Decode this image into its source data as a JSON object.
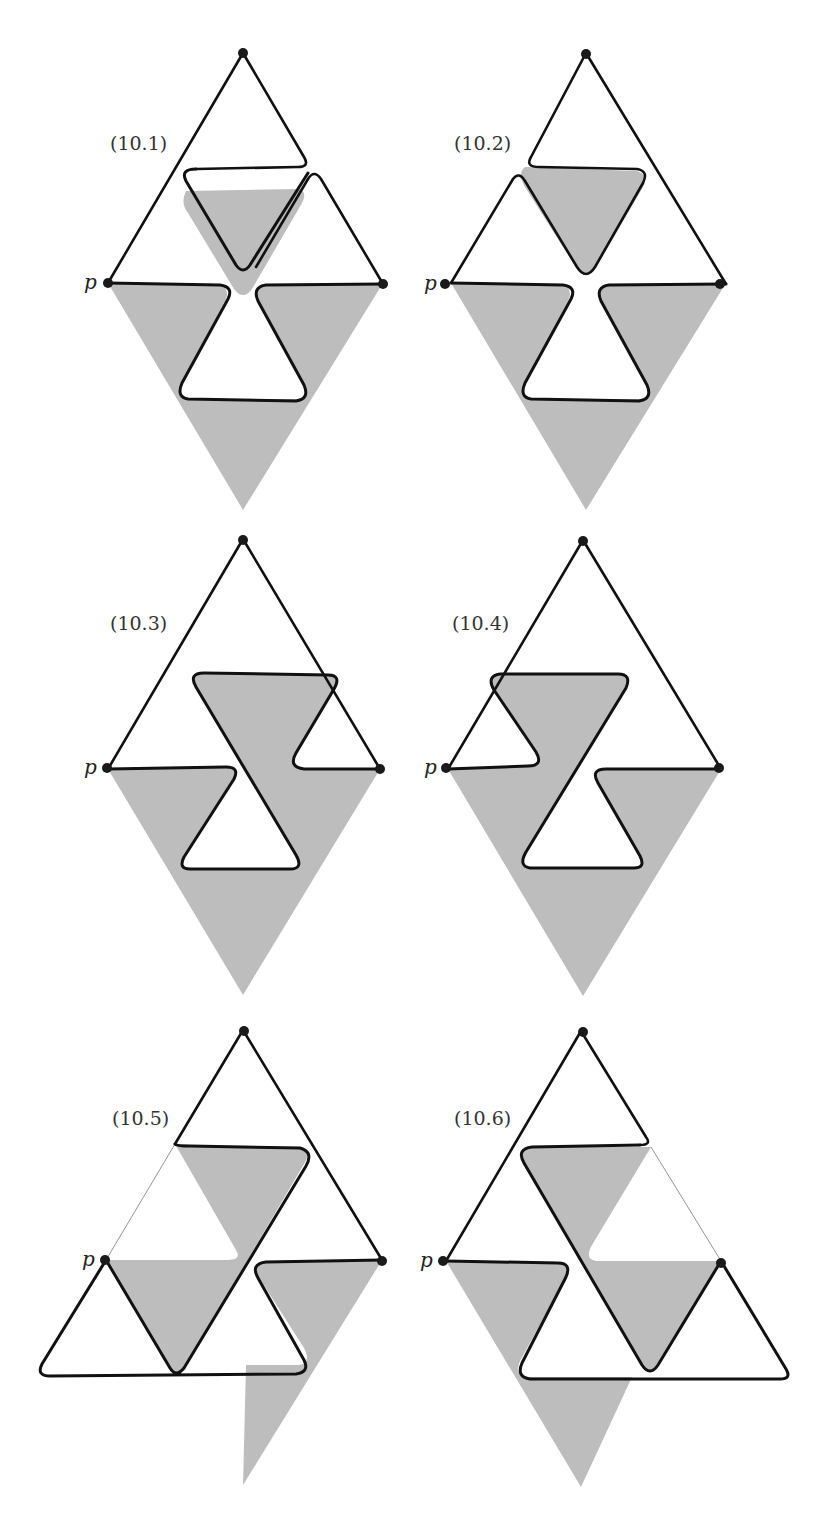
{
  "figure": {
    "panels": [
      {
        "id": "10.1",
        "label": "(10.1)",
        "vertex_label": "p",
        "origin": [
          108,
          53
        ]
      },
      {
        "id": "10.2",
        "label": "(10.2)",
        "vertex_label": "p",
        "origin": [
          451,
          53
        ]
      },
      {
        "id": "10.3",
        "label": "(10.3)",
        "vertex_label": "p",
        "origin": [
          108,
          539
        ]
      },
      {
        "id": "10.4",
        "label": "(10.4)",
        "vertex_label": "p",
        "origin": [
          448,
          540
        ]
      },
      {
        "id": "10.5",
        "label": "(10.5)",
        "vertex_label": "p",
        "origin": [
          106,
          1030
        ]
      },
      {
        "id": "10.6",
        "label": "(10.6)",
        "vertex_label": "p",
        "origin": [
          446,
          1031
        ]
      }
    ],
    "colors": {
      "shade": "#bdbdbd",
      "stroke": "#111111",
      "background": "#ffffff"
    }
  }
}
